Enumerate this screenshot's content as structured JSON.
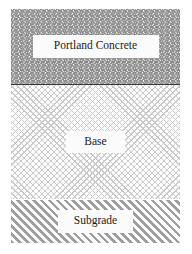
{
  "figure": {
    "layers": [
      {
        "id": "concrete",
        "label": "Portland Concrete",
        "pattern": "zigzag-wave-hatch",
        "pattern_color": "#8a8a8a"
      },
      {
        "id": "base",
        "label": "Base",
        "pattern": "fine-diagonal-crosshatch",
        "pattern_color": "#c9c9c9"
      },
      {
        "id": "subgrade",
        "label": "Subgrade",
        "pattern": "diagonal-stripes",
        "pattern_color": "#9e9e9e"
      }
    ],
    "background_color": "#ffffff",
    "divider_color": "#3a3a3a"
  }
}
